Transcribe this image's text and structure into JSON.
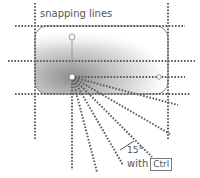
{
  "diagram": {
    "title": "snapping lines",
    "angle_label": "15°",
    "modifier_prefix": "with",
    "modifier_key": "Ctrl",
    "colors": {
      "dots": "#666666",
      "shape_fill_dark": "#9a9a9a",
      "shape_fill_light": "#ffffff",
      "handle": "#ffffff",
      "handle_stroke": "#888888",
      "text": "#555555"
    },
    "geometry": {
      "shape": {
        "x": 35,
        "y": 26,
        "width": 133,
        "height": 68,
        "radius": 12
      },
      "vertical_snap_lines_x": [
        35,
        72,
        168
      ],
      "horizontal_snap_lines_y": [
        26,
        61,
        77,
        94
      ],
      "pivot": {
        "x": 72,
        "y": 77
      },
      "rotation_handle": {
        "x": 72,
        "y": 37
      },
      "radial_angles_deg": [
        0,
        15,
        30,
        45,
        60,
        75,
        90
      ]
    }
  }
}
